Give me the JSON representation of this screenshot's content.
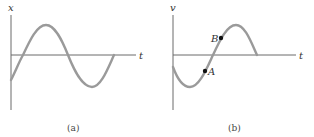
{
  "figure": {
    "panels": [
      {
        "id": "a",
        "caption": "(a)",
        "y_axis_label": "x",
        "x_axis_label": "t",
        "curve": "sinusoid starting below axis, rising to peak, falling to trough, returning to axis",
        "points": []
      },
      {
        "id": "b",
        "caption": "(b)",
        "y_axis_label": "v",
        "x_axis_label": "t",
        "curve": "sinusoid starting below axis, falling to trough, rising to peak, returning to axis",
        "points": [
          {
            "label": "A",
            "position": "below t-axis on rising segment"
          },
          {
            "label": "B",
            "position": "above t-axis on rising segment"
          }
        ]
      }
    ]
  },
  "colors": {
    "axis": "#6a6a6a",
    "curve": "#9a9a9a",
    "point": "#111111",
    "text": "#333333"
  }
}
